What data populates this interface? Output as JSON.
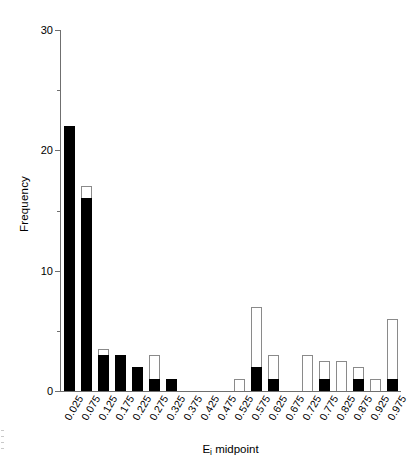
{
  "chart_data": {
    "type": "bar",
    "title": "",
    "xlabel": "Eᵢ midpoint",
    "ylabel": "Frequency",
    "ylim": [
      0,
      30
    ],
    "yticks": [
      0,
      10,
      20,
      30
    ],
    "yticks_minor": [
      5,
      15,
      25
    ],
    "grid": false,
    "legend": "none",
    "stacked": true,
    "categories": [
      "0.025",
      "0.075",
      "0.125",
      "0.175",
      "0.225",
      "0.275",
      "0.325",
      "0.375",
      "0.425",
      "0.475",
      "0.525",
      "0.575",
      "0.625",
      "0.675",
      "0.725",
      "0.775",
      "0.825",
      "0.875",
      "0.925",
      "0.975"
    ],
    "series": [
      {
        "name": "black",
        "color": "#000000",
        "values": [
          22,
          16,
          3,
          3,
          2,
          1,
          1,
          0,
          0,
          0,
          0,
          2,
          1,
          0,
          0,
          1,
          0,
          1,
          0,
          1
        ]
      },
      {
        "name": "white",
        "color": "#ffffff",
        "values": [
          22,
          17,
          3.5,
          3,
          2,
          3,
          1,
          0,
          0,
          0,
          1,
          7,
          3,
          0,
          3,
          2.5,
          2.5,
          2,
          1,
          6
        ]
      }
    ]
  },
  "axes": {
    "y_tick_labels": [
      "0",
      "10",
      "20",
      "30"
    ],
    "y_axis_title": "Frequency",
    "x_axis_title_main": "E",
    "x_axis_title_sub": "i",
    "x_axis_title_tail": " midpoint"
  }
}
